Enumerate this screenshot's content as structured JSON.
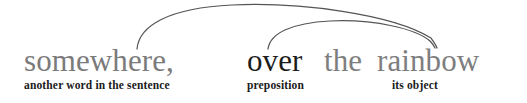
{
  "diagram": {
    "type": "grammar-annotation-diagram",
    "width": 527,
    "height": 103,
    "background_color": "#ffffff",
    "sentence": {
      "segments": [
        {
          "text": "somewhere,",
          "color": "#7b7b7b",
          "emphasis": "normal"
        },
        {
          "text": "over",
          "color": "#1c1c1c",
          "emphasis": "bold-dark"
        },
        {
          "text": "the",
          "color": "#7e7e7e",
          "emphasis": "normal"
        },
        {
          "text": "rainbow",
          "color": "#7e7e7e",
          "emphasis": "normal"
        }
      ]
    },
    "labels": [
      {
        "text": "another word in the sentence",
        "target": "somewhere,"
      },
      {
        "text": "preposition",
        "target": "over"
      },
      {
        "text": "its object",
        "target": "rainbow"
      }
    ],
    "arcs": [
      {
        "name": "outer-arc",
        "from": "another word in the sentence",
        "to": "its object",
        "color": "#555555"
      },
      {
        "name": "inner-arc",
        "from": "preposition",
        "to": "its object",
        "color": "#555555"
      }
    ]
  }
}
